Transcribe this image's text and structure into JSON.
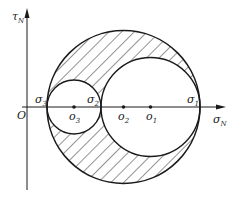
{
  "diagram": {
    "axes": {
      "origin_label": "O",
      "x_label": "σ",
      "x_label_sub": "N",
      "y_label": "τ",
      "y_label_sub": "N"
    },
    "stress_labels": {
      "sigma1": {
        "main": "σ",
        "sub": "1"
      },
      "sigma2": {
        "main": "σ",
        "sub": "2"
      },
      "sigma3": {
        "main": "σ",
        "sub": "3"
      }
    },
    "center_labels": {
      "o1": {
        "main": "o",
        "sub": "1"
      },
      "o2": {
        "main": "o",
        "sub": "2"
      },
      "o3": {
        "main": "o",
        "sub": "3"
      }
    },
    "geometry": {
      "axis_y": 107,
      "axis_x": 27,
      "sigma3_x": 47,
      "sigma2_x": 101,
      "sigma1_x": 200,
      "o3_x": 74,
      "o2_x": 123.5,
      "o1_x": 150.5
    },
    "colors": {
      "stroke": "#1a1a1a",
      "hatch": "#2a2a2a",
      "background": "#ffffff"
    },
    "shaded_region": "Area inside the large circle (σ1–σ3) but outside both smaller circles (σ3–σ2 and σ2–σ1), hatched diagonally"
  }
}
